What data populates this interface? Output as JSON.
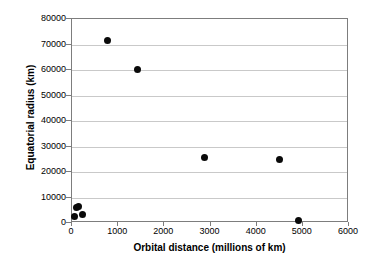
{
  "chart_data": {
    "type": "scatter",
    "title": "",
    "xlabel": "Orbital distance (millions of km)",
    "ylabel": "Equatorial radius (km)",
    "xlim": [
      0,
      6000
    ],
    "ylim": [
      0,
      80000
    ],
    "xticks": [
      0,
      1000,
      2000,
      3000,
      4000,
      5000,
      6000
    ],
    "yticks": [
      0,
      10000,
      20000,
      30000,
      40000,
      50000,
      60000,
      70000,
      80000
    ],
    "xtick_labels": [
      "0",
      "1000",
      "2000",
      "3000",
      "4000",
      "5000",
      "6000"
    ],
    "ytick_labels": [
      "0",
      "10000",
      "20000",
      "30000",
      "40000",
      "50000",
      "60000",
      "70000",
      "80000"
    ],
    "grid": "horizontal",
    "legend": "none",
    "marker": {
      "shape": "circle",
      "color": "#0a0a0a",
      "size": 7
    },
    "points": [
      {
        "x": 58,
        "y": 2440
      },
      {
        "x": 108,
        "y": 6052
      },
      {
        "x": 150,
        "y": 6378
      },
      {
        "x": 228,
        "y": 3397
      },
      {
        "x": 778,
        "y": 71492
      },
      {
        "x": 1429,
        "y": 60268
      },
      {
        "x": 2871,
        "y": 25559
      },
      {
        "x": 4504,
        "y": 24764
      },
      {
        "x": 4900,
        "y": 1150
      }
    ],
    "series": [
      {
        "name": "",
        "x": [
          58,
          108,
          150,
          228,
          778,
          1429,
          2871,
          4504,
          4900
        ],
        "values": [
          2440,
          6052,
          6378,
          3397,
          71492,
          60268,
          25559,
          24764,
          1150
        ]
      }
    ]
  },
  "axes": {
    "frame_color": "#7d7d7d",
    "grid_color": "#c9c9c9",
    "background": "#ffffff"
  }
}
